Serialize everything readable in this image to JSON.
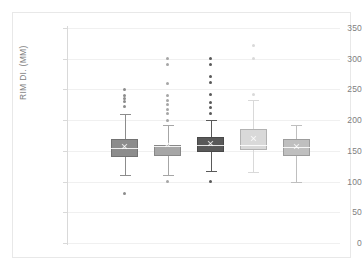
{
  "chart": {
    "title": "",
    "y_axis_title": "RIM DI. (MM)",
    "y_ticks": [
      "0",
      "50",
      "100",
      "150",
      "200",
      "250",
      "300",
      "350"
    ],
    "x_tick_labels": [
      "",
      "",
      "",
      "",
      ""
    ]
  },
  "chart_data": {
    "type": "box",
    "title": "",
    "xlabel": "",
    "ylabel": "RIM DI. (MM)",
    "ylim": [
      0,
      350
    ],
    "ytick_values": [
      0,
      50,
      100,
      150,
      200,
      250,
      300,
      350
    ],
    "grid": true,
    "legend": "none",
    "categories": [
      "1",
      "2",
      "3",
      "4",
      "5"
    ],
    "series": [
      {
        "name": "1",
        "color": "#8c8c8c",
        "min_whisker": 110,
        "q1": 140,
        "median": 155,
        "mean": 157,
        "q3": 170,
        "max_whisker": 210,
        "outliers": [
          250,
          240,
          235,
          230,
          222,
          80
        ]
      },
      {
        "name": "2",
        "color": "#a6a6a6",
        "min_whisker": 110,
        "q1": 142,
        "median": 158,
        "mean": 160,
        "q3": 160,
        "max_whisker": 192,
        "outliers": [
          300,
          290,
          260,
          240,
          232,
          225,
          218,
          211,
          200,
          100
        ]
      },
      {
        "name": "3",
        "color": "#595959",
        "min_whisker": 117,
        "q1": 148,
        "median": 160,
        "mean": 162,
        "q3": 172,
        "max_whisker": 201,
        "outliers": [
          301,
          291,
          271,
          261,
          241,
          228,
          220,
          211,
          100
        ]
      },
      {
        "name": "4",
        "color": "#d9d9d9",
        "min_whisker": 116,
        "q1": 152,
        "median": 160,
        "mean": 170,
        "q3": 186,
        "max_whisker": 232,
        "outliers": [
          321,
          301,
          241
        ]
      },
      {
        "name": "5",
        "color": "#bfbfbf",
        "min_whisker": 100,
        "q1": 141,
        "median": 157,
        "mean": 157,
        "q3": 170,
        "max_whisker": 192,
        "outliers": []
      }
    ]
  }
}
